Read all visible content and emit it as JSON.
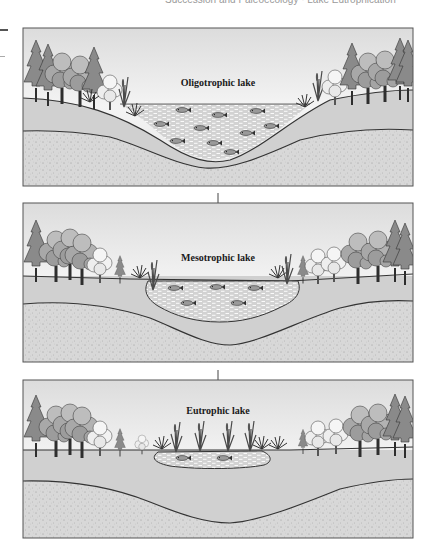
{
  "header": {
    "text": "Succession and Paleoecology · Lake Eutrophication"
  },
  "colors": {
    "sky_top": "#f2f2f2",
    "sky_bottom": "#d9d9d9",
    "soil_band": "#cfcfcf",
    "sediment": "#d6d6d6",
    "water": "#c9c9c9",
    "outline": "#3a3a3a",
    "tree_dark": "#7a7a7a",
    "tree_mid": "#a6a6a6",
    "tree_light": "#e6e6e6"
  },
  "panels": [
    {
      "id": "oligotrophic",
      "label": "Oligotrophic lake",
      "fish_count": 10,
      "stage": 1
    },
    {
      "id": "mesotrophic",
      "label": "Mesotrophic lake",
      "fish_count": 5,
      "stage": 2
    },
    {
      "id": "eutrophic",
      "label": "Eutrophic lake",
      "fish_count": 2,
      "stage": 3
    }
  ],
  "arrows": [
    {
      "from": "oligotrophic",
      "to": "mesotrophic"
    },
    {
      "from": "mesotrophic",
      "to": "eutrophic"
    }
  ]
}
